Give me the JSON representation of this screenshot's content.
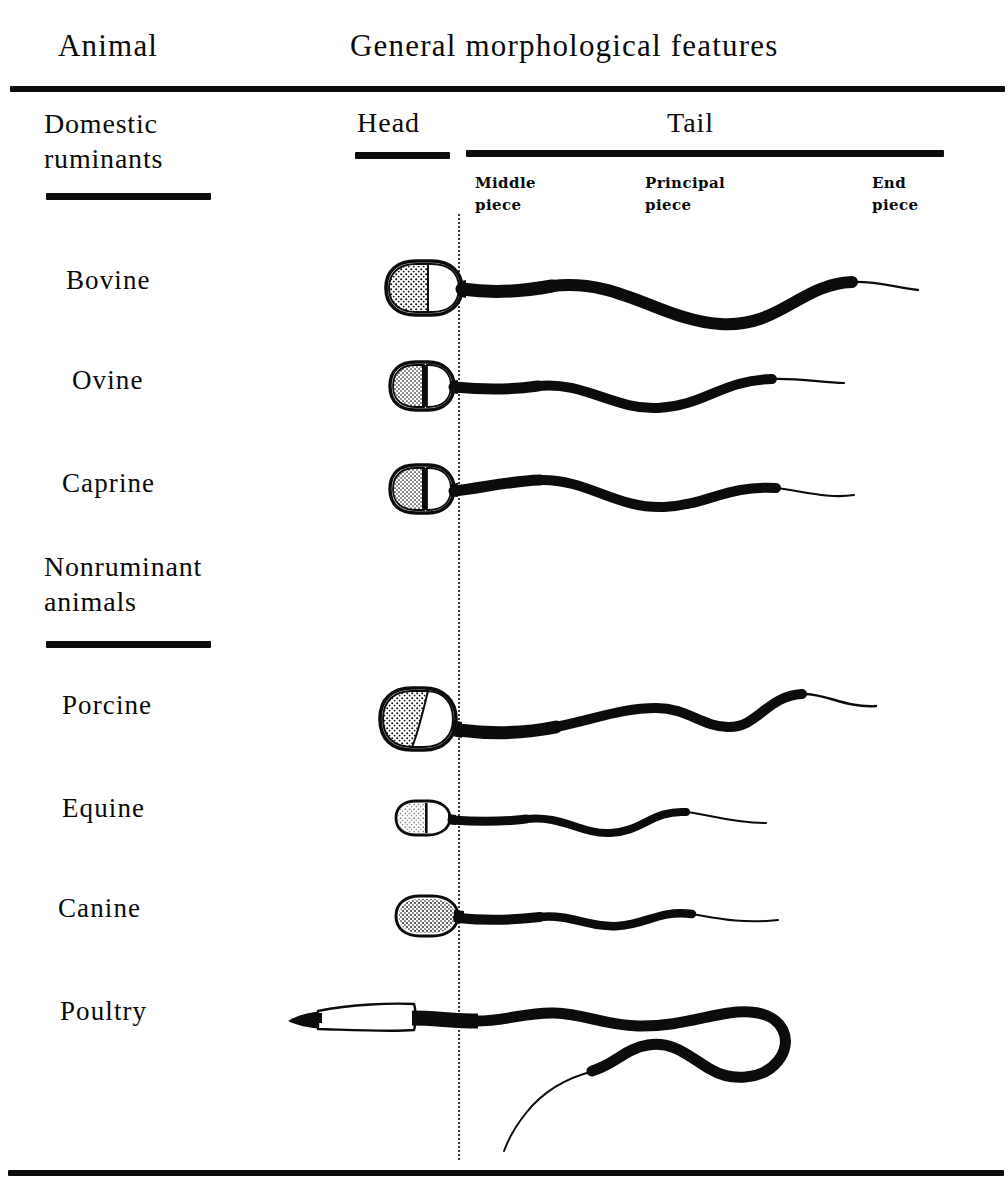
{
  "figure": {
    "type": "comparative-morphology-diagram"
  },
  "header": {
    "animal_column": "Animal",
    "features_column": "General morphological features"
  },
  "subheaders": {
    "head": "Head",
    "tail": "Tail"
  },
  "tail_parts": [
    {
      "line1": "Middle",
      "line2": "piece"
    },
    {
      "line1": "Principal",
      "line2": "piece"
    },
    {
      "line1": "End",
      "line2": "piece"
    }
  ],
  "groups": [
    {
      "id": "domestic-ruminants",
      "line1": "Domestic",
      "line2": "ruminants"
    },
    {
      "id": "nonruminant-animals",
      "line1": "Nonruminant",
      "line2": "animals"
    }
  ],
  "rows": [
    {
      "id": "bovine",
      "label": "Bovine",
      "group": "domestic-ruminants"
    },
    {
      "id": "ovine",
      "label": "Ovine",
      "group": "domestic-ruminants"
    },
    {
      "id": "caprine",
      "label": "Caprine",
      "group": "domestic-ruminants"
    },
    {
      "id": "porcine",
      "label": "Porcine",
      "group": "nonruminant-animals"
    },
    {
      "id": "equine",
      "label": "Equine",
      "group": "nonruminant-animals"
    },
    {
      "id": "canine",
      "label": "Canine",
      "group": "nonruminant-animals"
    },
    {
      "id": "poultry",
      "label": "Poultry",
      "group": "nonruminant-animals"
    }
  ],
  "colors": {
    "ink": "#0c0c0c",
    "paper": "#ffffff",
    "divider": "#3a3a3a"
  }
}
